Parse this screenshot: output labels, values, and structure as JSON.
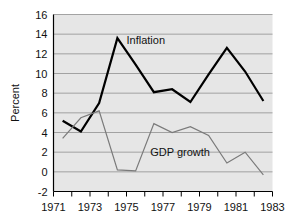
{
  "chart_data": {
    "type": "line",
    "title": "",
    "subtitle": "",
    "xlabel": "",
    "ylabel": "Percent",
    "xlim": [
      1971,
      1983
    ],
    "ylim": [
      -2,
      16
    ],
    "x_tick_labels": [
      "1971",
      "1973",
      "1975",
      "1977",
      "1979",
      "1981",
      "1983"
    ],
    "x_tick_values": [
      1971,
      1973,
      1975,
      1977,
      1979,
      1981,
      1983
    ],
    "x_minor_tick_values": [
      1971,
      1972,
      1973,
      1974,
      1975,
      1976,
      1977,
      1978,
      1979,
      1980,
      1981,
      1982,
      1983
    ],
    "y_tick_labels": [
      "16",
      "14",
      "12",
      "10",
      "8",
      "6",
      "4",
      "2",
      "0",
      "-2"
    ],
    "y_tick_values": [
      16,
      14,
      12,
      10,
      8,
      6,
      4,
      2,
      0,
      -2
    ],
    "grid": "horizontal",
    "legend_position": "inline-annotations",
    "plot_background_color": "#e6e6e6",
    "grid_color": "#9a9a9a",
    "axis_color": "#000000",
    "x": [
      1971.5,
      1972.5,
      1973.5,
      1974.5,
      1975.5,
      1976.5,
      1977.5,
      1978.5,
      1979.5,
      1980.5,
      1981.5,
      1982.5
    ],
    "series": [
      {
        "name": "Inflation",
        "color": "#000000",
        "line_width": 2.2,
        "values": [
          5.2,
          4.1,
          7.0,
          13.6,
          10.9,
          8.1,
          8.4,
          7.1,
          9.9,
          12.6,
          10.2,
          7.2
        ],
        "annotation": {
          "text": "Inflation",
          "x": 1975.0,
          "y": 13.0
        }
      },
      {
        "name": "GDP growth",
        "color": "#7a7a7a",
        "line_width": 1.2,
        "values": [
          3.4,
          5.5,
          6.2,
          0.2,
          0.1,
          4.9,
          4.0,
          4.6,
          3.7,
          0.9,
          2.0,
          -0.3
        ],
        "annotation": {
          "text": "GDP growth",
          "x": 1976.3,
          "y": 1.6
        }
      }
    ]
  }
}
